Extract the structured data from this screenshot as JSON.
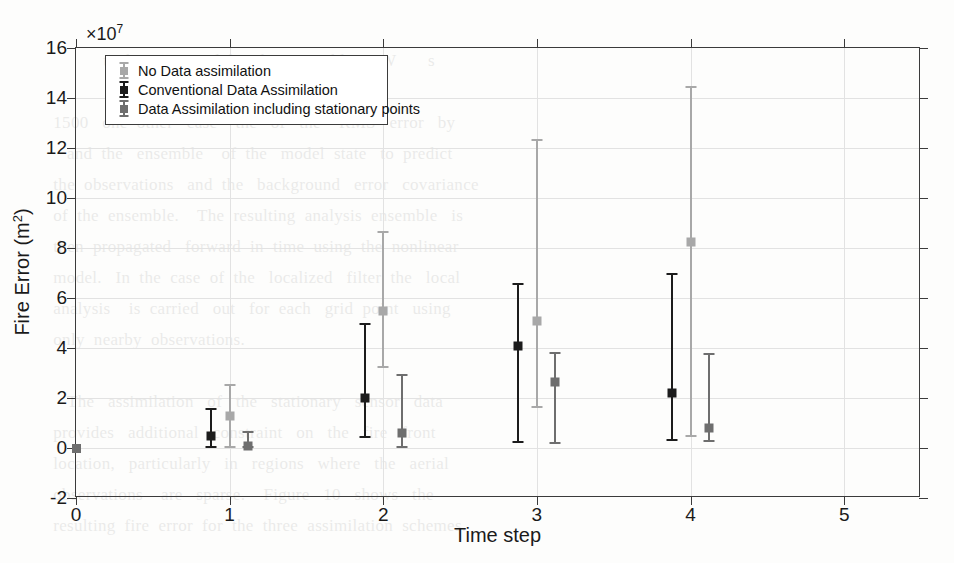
{
  "chart_data": {
    "type": "scatter",
    "title": "",
    "xlabel": "Time step",
    "ylabel": "Fire Error (m2)",
    "ylabel_base": "Fire Error (m",
    "ylabel_sup": "2",
    "ylabel_tail": ")",
    "y_exponent_prefix": "×10",
    "y_exponent_power": "7",
    "y_multiplier": 10000000.0,
    "xlim": [
      0,
      5.5
    ],
    "ylim": [
      -2,
      16
    ],
    "xticks": [
      0,
      1,
      2,
      3,
      4,
      5
    ],
    "xtick_labels": [
      "0",
      "1",
      "2",
      "3",
      "4",
      "5"
    ],
    "yticks": [
      -2,
      0,
      2,
      4,
      6,
      8,
      10,
      12,
      14,
      16
    ],
    "ytick_labels": [
      "-2",
      "0",
      "2",
      "4",
      "6",
      "8",
      "10",
      "12",
      "14",
      "16"
    ],
    "grid": true,
    "legend_position": "top-left-inside",
    "error_bar_style": "vertical with caps, square center marker",
    "group_offsets": [
      -0.12,
      0.0,
      0.12
    ],
    "categories": [
      1,
      2,
      3,
      4
    ],
    "series": [
      {
        "name": "No Data assimilation",
        "color": "#a8a8a8",
        "offset": 0.0,
        "values": [
          1.3,
          5.5,
          5.1,
          8.25
        ],
        "lower": [
          0.0,
          3.2,
          1.6,
          0.45
        ],
        "upper": [
          2.55,
          8.7,
          12.35,
          14.5
        ]
      },
      {
        "name": "Conventional Data Assimilation",
        "color": "#1c1c1c",
        "offset": -0.12,
        "values": [
          0.5,
          2.0,
          4.1,
          2.2
        ],
        "lower": [
          0.0,
          0.4,
          0.2,
          0.3
        ],
        "upper": [
          1.6,
          5.0,
          6.6,
          7.0
        ]
      },
      {
        "name": "Data Assimilation including stationary points",
        "color": "#6e6e6e",
        "offset": 0.12,
        "values": [
          0.1,
          0.6,
          2.65,
          0.8
        ],
        "lower": [
          0.0,
          0.0,
          0.15,
          0.25
        ],
        "upper": [
          0.7,
          2.95,
          3.85,
          3.8
        ]
      }
    ],
    "origin_marker": {
      "x": 0,
      "y": 0,
      "color": "#6e6e6e"
    },
    "annotations": []
  },
  "legend": {
    "entries": [
      {
        "label": "No Data assimilation",
        "color": "#a8a8a8"
      },
      {
        "label": "Conventional Data Assimilation",
        "color": "#1c1c1c"
      },
      {
        "label": "Data Assimilation including stationary points",
        "color": "#6e6e6e"
      }
    ]
  },
  "page_bleed": "                                                                              \n                 to  be  estimated  by  the  ensemble      W       s\n                                      member\n      1500   one  other   case    the   of   the    RMS   error   by\n         and  the   ensemble    of  the   model  state   to  predict\n      the  observations   and  the   background   error   covariance\n      of  the  ensemble.    The  resulting  analysis  ensemble   is\n      then  propagated   forward  in  time  using  the  nonlinear\n      model.   In  the  case  of  the   localized   filter  the   local\n      analysis    is  carried   out   for  each   grid  point   using\n      only  nearby  observations.\n\n         The   assimilation   of   the   stationary   sensor   data\n      provides   additional   constraint   on   the   fire   front\n      location,   particularly   in   regions   where   the   aerial\n      observations    are   sparse.    Figure   10   shows   the\n      resulting  fire  error  for  the  three  assimilation  schemes."
}
